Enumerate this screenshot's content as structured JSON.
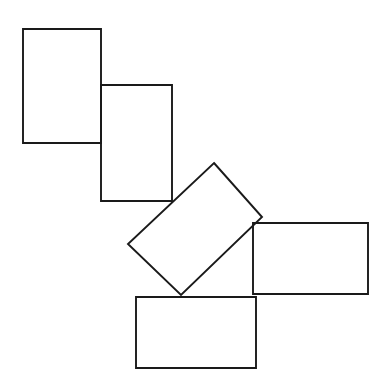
{
  "figure": {
    "canvas": {
      "width": 389,
      "height": 391,
      "background_color": "#ffffff"
    },
    "style": {
      "stroke_color": "#1a1a1a",
      "stroke_width": 1.9,
      "fill": "none"
    },
    "shape_count": 5,
    "shapes": [
      {
        "name": "rectangle-top-left",
        "orientation": "upright",
        "rotation_degrees": 0,
        "points": "23,29 101,29 101,143 23,143"
      },
      {
        "name": "rectangle-upper-middle",
        "orientation": "upright",
        "rotation_degrees": 0,
        "points": "101,85 172,85 172,201 101,201"
      },
      {
        "name": "rectangle-center-rotated",
        "orientation": "rotated",
        "rotation_degrees": -48,
        "points": "214,163 262,217 181,295 128,244"
      },
      {
        "name": "rectangle-right",
        "orientation": "upright",
        "rotation_degrees": 0,
        "points": "253,223 368,223 368,294 253,294"
      },
      {
        "name": "rectangle-bottom",
        "orientation": "upright",
        "rotation_degrees": 0,
        "points": "136,297 256,297 256,368 136,368"
      }
    ]
  }
}
